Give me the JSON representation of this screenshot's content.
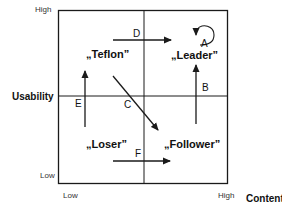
{
  "diagram": {
    "y_axis": {
      "title": "Usability",
      "high": "High",
      "low": "Low"
    },
    "x_axis": {
      "title": "Content",
      "low": "Low",
      "high": "High"
    },
    "quadrants": {
      "top_left": "„Teflon”",
      "top_right": "„Leader”",
      "bottom_left": "„Loser”",
      "bottom_right": "„Follower”"
    },
    "transitions": [
      {
        "id": "A",
        "from": "Leader",
        "to": "Leader",
        "type": "self-loop"
      },
      {
        "id": "B",
        "from": "Follower",
        "to": "Leader",
        "type": "upward"
      },
      {
        "id": "C",
        "from": "Teflon",
        "to": "Follower",
        "type": "diagonal"
      },
      {
        "id": "D",
        "from": "Teflon",
        "to": "Leader",
        "type": "rightward"
      },
      {
        "id": "E",
        "from": "Loser",
        "to": "Teflon",
        "type": "upward"
      },
      {
        "id": "F",
        "from": "Loser",
        "to": "Follower",
        "type": "rightward"
      }
    ],
    "line_color": "#1a1a1a"
  }
}
